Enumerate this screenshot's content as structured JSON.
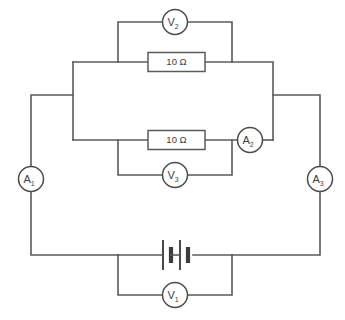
{
  "diagram": {
    "type": "schematic",
    "background_color": "#ffffff",
    "wire_color": "#5b5b5b"
  },
  "components": {
    "voltmeter_v2": {
      "label": "V",
      "subscript": "2",
      "name": "V2",
      "kind": "voltmeter"
    },
    "voltmeter_v3": {
      "label": "V",
      "subscript": "3",
      "name": "V3",
      "kind": "voltmeter"
    },
    "voltmeter_v1": {
      "label": "V",
      "subscript": "1",
      "name": "V1",
      "kind": "voltmeter"
    },
    "ammeter_a1": {
      "label": "A",
      "subscript": "1",
      "name": "A1",
      "kind": "ammeter"
    },
    "ammeter_a2": {
      "label": "A",
      "subscript": "2",
      "name": "A2",
      "kind": "ammeter"
    },
    "ammeter_a3": {
      "label": "A",
      "subscript": "3",
      "name": "A3",
      "kind": "ammeter"
    },
    "resistor_top": {
      "value": "10 Ω",
      "name": "R1",
      "kind": "resistor"
    },
    "resistor_bottom": {
      "value": "10 Ω",
      "name": "R2",
      "kind": "resistor"
    },
    "battery": {
      "name": "battery",
      "kind": "battery",
      "cells": "2"
    }
  }
}
